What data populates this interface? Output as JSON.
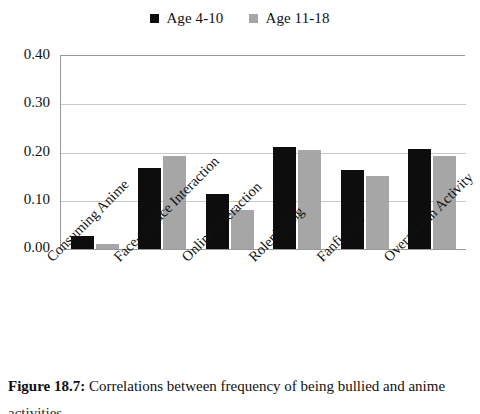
{
  "chart_data": {
    "type": "bar",
    "title": "",
    "xlabel": "",
    "ylabel": "",
    "ylim": [
      0.0,
      0.4
    ],
    "yticks": [
      "0.00",
      "0.10",
      "0.20",
      "0.30",
      "0.40"
    ],
    "ytick_values": [
      0.0,
      0.1,
      0.2,
      0.3,
      0.4
    ],
    "grid": true,
    "legend_position": "top-center",
    "categories": [
      "Consuming Anime",
      "Face-to-Face Interaction",
      "Online Interaction",
      "Roleplaying",
      "Fanfiction",
      "Overall Fan Activity"
    ],
    "series": [
      {
        "name": "Age 4-10",
        "color": "#0d0d0d",
        "values": [
          0.027,
          0.168,
          0.115,
          0.211,
          0.163,
          0.207
        ]
      },
      {
        "name": "Age 11-18",
        "color": "#a6a6a6",
        "values": [
          0.01,
          0.193,
          0.08,
          0.206,
          0.152,
          0.193
        ]
      }
    ]
  },
  "legend": {
    "items": [
      {
        "label": "Age 4-10",
        "color": "#0d0d0d"
      },
      {
        "label": "Age 11-18",
        "color": "#a6a6a6"
      }
    ]
  },
  "caption": {
    "figure_number": "Figure 18.7:",
    "text": " Correlations between frequency of being bullied and anime",
    "line2": "activities"
  }
}
